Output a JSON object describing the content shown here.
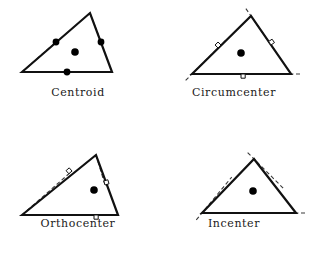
{
  "figure": {
    "background": "#ffffff",
    "stroke_color": "#111111",
    "dash_color": "#3a3a3a",
    "point_color": "#000000"
  },
  "panels": [
    {
      "id": "centroid",
      "caption": "Centroid",
      "origin": [
        0,
        0
      ],
      "caption_y": 86,
      "triangle": {
        "a": [
          22,
          72
        ],
        "b": [
          90,
          13
        ],
        "c": [
          112,
          72
        ]
      },
      "cevian_kind": "median",
      "center_point": [
        75,
        52
      ],
      "foot_points": [
        [
          56,
          42
        ],
        [
          101,
          42
        ],
        [
          67,
          72
        ]
      ],
      "show_foot_dots": true,
      "show_right_angles": false,
      "extend_beyond": false
    },
    {
      "id": "circumcenter",
      "caption": "Circumcenter",
      "origin": [
        156,
        0
      ],
      "caption_y": 86,
      "triangle": {
        "a": [
          36,
          74
        ],
        "b": [
          95,
          16
        ],
        "c": [
          135,
          74
        ]
      },
      "cevian_kind": "perpendicular-bisector",
      "center_point": [
        85,
        53
      ],
      "foot_points": [
        [
          65,
          45
        ],
        [
          115,
          45
        ],
        [
          85,
          74
        ]
      ],
      "show_foot_dots": false,
      "show_right_angles": true,
      "extend_beyond": true
    },
    {
      "id": "orthocenter",
      "caption": "Orthocenter",
      "origin": [
        0,
        127
      ],
      "caption_y": 90,
      "triangle": {
        "a": [
          22,
          88
        ],
        "b": [
          96,
          28
        ],
        "c": [
          118,
          88
        ]
      },
      "cevian_kind": "altitude",
      "center_point": [
        94,
        63
      ],
      "foot_points": [
        [
          72,
          44
        ],
        [
          105,
          58
        ],
        [
          94,
          88
        ]
      ],
      "show_foot_dots": false,
      "show_right_angles": true,
      "extend_beyond": false
    },
    {
      "id": "incenter",
      "caption": "Incenter",
      "origin": [
        156,
        127
      ],
      "caption_y": 90,
      "triangle": {
        "a": [
          46,
          86
        ],
        "b": [
          98,
          32
        ],
        "c": [
          140,
          86
        ]
      },
      "cevian_kind": "angle-bisector",
      "center_point": [
        97,
        64
      ],
      "foot_points": [
        [
          70,
          57
        ],
        [
          122,
          56
        ],
        [
          97,
          86
        ]
      ],
      "show_foot_dots": false,
      "show_right_angles": false,
      "extend_beyond": true
    }
  ]
}
